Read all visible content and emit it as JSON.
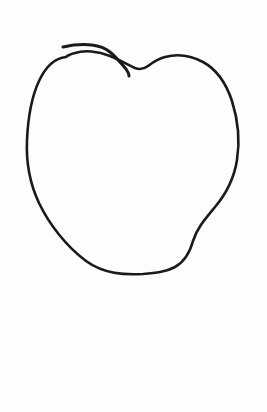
{
  "page": {
    "title": "Hand-drawn apple outline sketch",
    "background_color": "#fefefe",
    "paper_color": "#ffffff",
    "width": 267,
    "height": 412,
    "caption": "Hand-drawn apple outline sketch on white paper"
  },
  "drawing": {
    "name": "apple-outline-sketch",
    "medium": "pen on paper",
    "ink_color": "#1a1a1a",
    "stroke_count": 2,
    "bounding_box": {
      "x": 26,
      "y": 43,
      "width": 214,
      "height": 232
    },
    "strokes": [
      {
        "id": "main-outline",
        "label": "apple body outline",
        "closed": true,
        "stroke_width": 2.6,
        "path": "M 66 57 C 56 58, 46 66, 39 81 C 32 96, 28 118, 27 140 C 26 162, 30 184, 39 203 C 49 224, 66 246, 86 261 C 104 274, 124 275, 143 274 C 155 273, 166 272, 175 267 C 184 262, 190 252, 193 241 C 197 228, 205 219, 215 207 C 226 194, 234 179, 237 160 C 240 141, 238 120, 232 101 C 226 83, 216 69, 203 62 C 190 55, 176 54, 165 57 C 157 59, 152 63, 148 66 C 144 69, 140 70, 135 68 C 128 65, 120 60, 110 56 C 98 51, 84 50, 75 53 C 71 54, 68 55, 66 57 Z"
      },
      {
        "id": "stem-mark",
        "label": "overlapping stem stroke at top",
        "closed": false,
        "stroke_width": 3.0,
        "path": "M 63 47 C 72 45, 82 44, 92 45 C 100 46, 105 48, 110 52 C 116 57, 121 63, 126 69 C 128 72, 129 74, 129 76"
      }
    ]
  },
  "annotations": {
    "top_notch": {
      "label": "top center notch",
      "x": 143,
      "y": 66
    },
    "leftmost_point": {
      "label": "left edge extreme",
      "x": 27,
      "y": 145
    },
    "rightmost_point": {
      "label": "right edge extreme",
      "x": 238,
      "y": 152
    },
    "bottom_point": {
      "label": "bottom flat base",
      "x": 152,
      "y": 274
    },
    "right_kink": {
      "label": "lower right angular kink",
      "x": 193,
      "y": 241
    }
  }
}
